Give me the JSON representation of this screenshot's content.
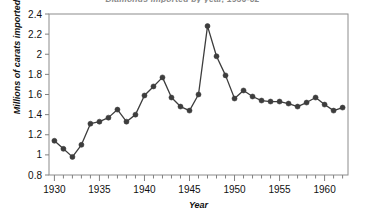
{
  "chart_data": {
    "type": "line",
    "title": "Diamonds imported by year, 1930-62",
    "title_clipped": true,
    "xlabel": "Year",
    "ylabel": "Millions of carats imported",
    "xlim": [
      1929.4,
      1962.6
    ],
    "ylim": [
      0.8,
      2.4
    ],
    "yticks": [
      0.8,
      1,
      1.2,
      1.4,
      1.6,
      1.8,
      2,
      2.2,
      2.4
    ],
    "ytick_labels": [
      "0.8",
      "1",
      "1.2",
      "1.4",
      "1.6",
      "1.8",
      "2",
      "2.2",
      "2.4"
    ],
    "xticks": [
      1930,
      1935,
      1940,
      1945,
      1950,
      1955,
      1960
    ],
    "xtick_labels": [
      "1930",
      "1935",
      "1940",
      "1945",
      "1950",
      "1955",
      "1960"
    ],
    "xtick_minor_step": 1,
    "grid": false,
    "legend": false,
    "marker": "circle",
    "line_color": "#3d3d3d",
    "marker_color": "#3d3d3d",
    "axis_color": "#808080",
    "background": "#ffffff",
    "x": [
      1930,
      1931,
      1932,
      1933,
      1934,
      1935,
      1936,
      1937,
      1938,
      1939,
      1940,
      1941,
      1942,
      1943,
      1944,
      1945,
      1946,
      1947,
      1948,
      1949,
      1950,
      1951,
      1952,
      1953,
      1954,
      1955,
      1956,
      1957,
      1958,
      1959,
      1960,
      1961,
      1962
    ],
    "values": [
      1.14,
      1.06,
      0.98,
      1.1,
      1.31,
      1.33,
      1.37,
      1.45,
      1.33,
      1.4,
      1.59,
      1.68,
      1.77,
      1.57,
      1.48,
      1.44,
      1.6,
      2.28,
      1.98,
      1.79,
      1.56,
      1.64,
      1.58,
      1.54,
      1.53,
      1.53,
      1.51,
      1.48,
      1.52,
      1.57,
      1.5,
      1.44,
      1.47
    ],
    "series": [
      {
        "name": "Millions of carats imported",
        "values": [
          1.14,
          1.06,
          0.98,
          1.1,
          1.31,
          1.33,
          1.37,
          1.45,
          1.33,
          1.4,
          1.59,
          1.68,
          1.77,
          1.57,
          1.48,
          1.44,
          1.6,
          2.28,
          1.98,
          1.79,
          1.56,
          1.64,
          1.58,
          1.54,
          1.53,
          1.53,
          1.51,
          1.48,
          1.52,
          1.57,
          1.5,
          1.44,
          1.47
        ]
      }
    ],
    "annotations": []
  }
}
